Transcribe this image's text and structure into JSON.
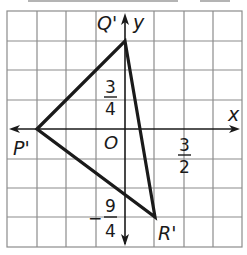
{
  "diagram": {
    "type": "coordinate-plane-triangle",
    "grid": {
      "columns": 8,
      "rows": 8,
      "unit": "3/4"
    },
    "axes": {
      "x_label": "x",
      "y_label": "y",
      "origin_label": "O"
    },
    "vertices": [
      {
        "name": "P'",
        "label": "P'",
        "x": "-9/4",
        "y": "0"
      },
      {
        "name": "Q'",
        "label": "Q'",
        "x": "0",
        "y": "9/4"
      },
      {
        "name": "R'",
        "label": "R'",
        "x": "3/4",
        "y": "-9/4"
      }
    ],
    "tick_labels": {
      "y_pos": {
        "num": "3",
        "den": "4"
      },
      "x_pos": {
        "num": "3",
        "den": "2"
      },
      "y_neg": {
        "sign": "−",
        "num": "9",
        "den": "4"
      }
    },
    "colors": {
      "grid": "#8c8c8c",
      "line": "#1a1a1a",
      "background": "#ffffff"
    }
  }
}
